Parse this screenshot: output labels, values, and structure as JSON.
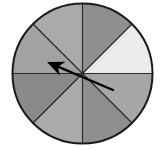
{
  "figure": {
    "name": "spinner-wheel",
    "background_color": "#ffffff",
    "width": 163,
    "height": 150
  },
  "chart_data": {
    "type": "pie",
    "xlabel": "",
    "ylabel": "",
    "legend_position": "none",
    "grid": false,
    "center_x": 82.5,
    "center_y": 73.5,
    "radius": 70,
    "sector_count": 8,
    "sector_angle_degrees": 45,
    "categories": [
      "sector-1",
      "sector-2",
      "sector-3",
      "sector-4",
      "sector-5",
      "sector-6",
      "sector-7",
      "sector-8"
    ],
    "values": [
      12.5,
      12.5,
      12.5,
      12.5,
      12.5,
      12.5,
      12.5,
      12.5
    ],
    "slices": [
      {
        "name": "sector-1",
        "start_angle": 0,
        "end_angle": 45,
        "value": 12.5,
        "color": "#ebebeb",
        "shade": "very light gray"
      },
      {
        "name": "sector-2",
        "start_angle": 45,
        "end_angle": 90,
        "value": 12.5,
        "color": "#8f8f8f",
        "shade": "medium gray"
      },
      {
        "name": "sector-3",
        "start_angle": 90,
        "end_angle": 135,
        "value": 12.5,
        "color": "#aaaaaa",
        "shade": "light gray"
      },
      {
        "name": "sector-4",
        "start_angle": 135,
        "end_angle": 180,
        "value": 12.5,
        "color": "#a2a2a2",
        "shade": "light-medium gray"
      },
      {
        "name": "sector-5",
        "start_angle": 180,
        "end_angle": 225,
        "value": 12.5,
        "color": "#8a8a8a",
        "shade": "medium-dark gray"
      },
      {
        "name": "sector-6",
        "start_angle": 225,
        "end_angle": 270,
        "value": 12.5,
        "color": "#ababab",
        "shade": "light gray"
      },
      {
        "name": "sector-7",
        "start_angle": 270,
        "end_angle": 315,
        "value": 12.5,
        "color": "#8f8f8f",
        "shade": "medium gray"
      },
      {
        "name": "sector-8",
        "start_angle": 315,
        "end_angle": 360,
        "value": 12.5,
        "color": "#a6a6a6",
        "shade": "light-medium gray"
      }
    ],
    "pointer": {
      "name": "spinner-arrow",
      "direction_degrees": 157,
      "tail_degrees": -23,
      "color": "#000000",
      "tail_x": 113,
      "tail_y": 90,
      "tip_x": 47,
      "tip_y": 62
    },
    "outline": {
      "color": "#1a1a1a",
      "width": 2
    },
    "divider": {
      "color": "#2b2b2b",
      "width": 1.2,
      "lines_degrees": [
        0,
        45,
        90,
        135
      ]
    }
  }
}
